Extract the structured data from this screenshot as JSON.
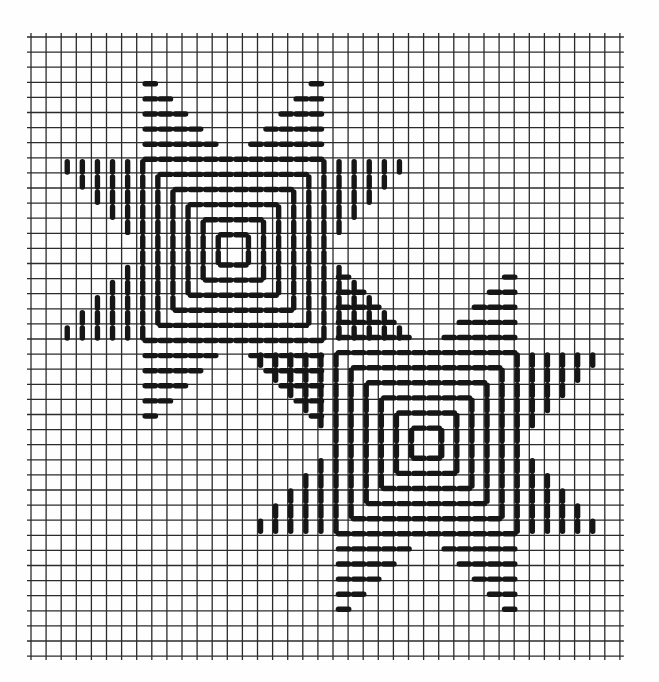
{
  "document": {
    "title": "Eight-Pointed Star Needlepoint Chart",
    "kind": "graph-paper-stitch-diagram",
    "background_color": "#fefefe",
    "paper_tint": "#f7f7f4"
  },
  "grid": {
    "label": "graph paper grid",
    "origin_x": 31,
    "origin_y": 37,
    "cell_size": 15.1,
    "cols": 39,
    "rows": 41,
    "line_color": "#2b2b2b",
    "line_width": 1.3,
    "heavy_line_width": 1.3,
    "visible": true
  },
  "stitch": {
    "color": "#161616",
    "width": 5.4,
    "gap": 0.16,
    "cap": "round",
    "description": "diagonal satin stitches spanning one grid cell, drawn with small gaps at grid intersections"
  },
  "motifs": {
    "type": "eight-pointed LeMoyne star",
    "arm_length_cells": 6,
    "arm_half_width_cells": 3,
    "count": 2,
    "stars": [
      {
        "name": "upper-left-star",
        "center_col": 13.4,
        "center_row": 14.1,
        "arm_cells": 6
      },
      {
        "name": "lower-right-star",
        "center_col": 26.2,
        "center_row": 26.9,
        "arm_cells": 6
      }
    ]
  },
  "colors": {
    "ink": "#161616",
    "grid": "#2b2b2b",
    "paper": "#fefefe",
    "tint": "#f6f6f3"
  },
  "chart_data": {
    "type": "table",
    "title": "Eight-Pointed Star Needlepoint Chart",
    "xlabel": "grid columns",
    "ylabel": "grid rows",
    "categories": [
      "upper-left-star",
      "lower-right-star"
    ],
    "values": [
      1,
      1
    ]
  }
}
